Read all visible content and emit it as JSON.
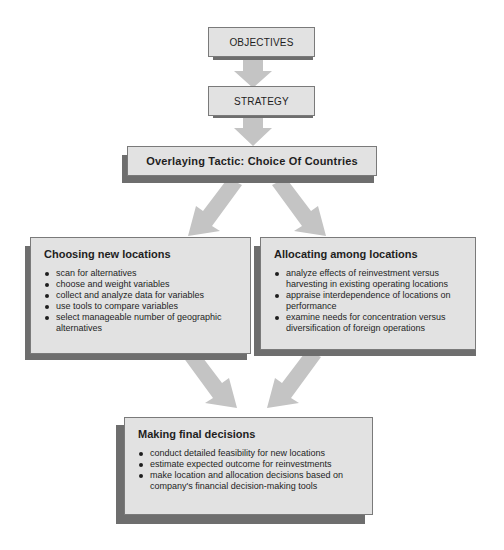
{
  "diagram": {
    "objectives": {
      "label": "OBJECTIVES"
    },
    "strategy": {
      "label": "STRATEGY"
    },
    "tactic": {
      "label": "Overlaying Tactic: Choice Of Countries"
    },
    "choosing": {
      "title": "Choosing new locations",
      "items": [
        "scan for alternatives",
        "choose and weight variables",
        "collect and analyze data for variables",
        "use tools to compare variables",
        "select manageable number of geographic alternatives"
      ]
    },
    "allocating": {
      "title": "Allocating among locations",
      "items": [
        "analyze effects of reinvestment versus harvesting in existing operating locations",
        "appraise interdependence of locations on performance",
        "examine needs for concentration versus diversification of foreign operations"
      ]
    },
    "final": {
      "title": "Making final decisions",
      "items": [
        "conduct detailed feasibility for new locations",
        "estimate expected outcome for reinvestments",
        "make location and allocation decisions based on company's financial decision-making tools"
      ]
    },
    "colors": {
      "box_fill": "#e2e2e2",
      "box_border": "#7a7a7a",
      "shadow": "#6e6e6e",
      "arrow": "#c4c4c4"
    }
  }
}
